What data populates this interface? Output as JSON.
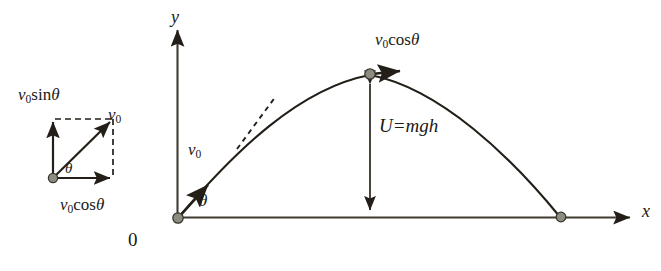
{
  "figure": {
    "background_color": "#ffffff",
    "line_color": "#231f18",
    "dot_fill": "#8c8c80",
    "dot_stroke": "#3a362c",
    "width": 661,
    "height": 271
  },
  "vector_inset": {
    "name": "velocity-component-triangle",
    "origin_label": "",
    "vertical_component_label": {
      "base": "v",
      "sub": "0",
      "func": "sin",
      "angle": "θ",
      "full": "v₀sinθ"
    },
    "horizontal_component_label": {
      "base": "v",
      "sub": "0",
      "func": "cos",
      "angle": "θ",
      "full": "v₀cosθ"
    },
    "resultant_label": {
      "base": "v",
      "sub": "0",
      "full": "v₀"
    },
    "angle_label": "θ"
  },
  "axes": {
    "y_label": "y",
    "x_label": "x",
    "origin_label": "0"
  },
  "trajectory": {
    "launch_velocity_label": {
      "base": "v",
      "sub": "0",
      "full": "v₀"
    },
    "launch_angle_label": "θ",
    "apex_velocity_label": {
      "base": "v",
      "sub": "0",
      "func": "cos",
      "angle": "θ",
      "full": "v₀cosθ"
    },
    "height_energy_label": "U=mgh",
    "tangent_line_style": "dashed"
  }
}
